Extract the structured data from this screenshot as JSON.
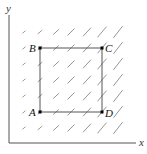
{
  "diagram": {
    "type": "vector-field",
    "axes": {
      "x_label": "x",
      "y_label": "y",
      "origin": [
        9,
        143
      ],
      "x_end": [
        136,
        143
      ],
      "y_end": [
        9,
        15
      ]
    },
    "field": {
      "columns_x": [
        24,
        40,
        56,
        71,
        87,
        102,
        118
      ],
      "rows_y": [
        32,
        48,
        64,
        80,
        96,
        112,
        128
      ],
      "segment_lengths_by_column": [
        3,
        5,
        7,
        9,
        11,
        13,
        14
      ],
      "angle_deg_by_column": [
        40,
        40,
        42,
        45,
        47,
        50,
        52
      ],
      "color": "#8a8a8a"
    },
    "square": {
      "vertices": [
        {
          "name": "A",
          "x": 40,
          "y": 112,
          "label_dx": -11,
          "label_dy": 4
        },
        {
          "name": "B",
          "x": 40,
          "y": 48,
          "label_dx": -11,
          "label_dy": 4
        },
        {
          "name": "C",
          "x": 102,
          "y": 48,
          "label_dx": 3,
          "label_dy": 4
        },
        {
          "name": "D",
          "x": 102,
          "y": 112,
          "label_dx": 3,
          "label_dy": 5
        }
      ],
      "edge_color": "#555555"
    }
  }
}
